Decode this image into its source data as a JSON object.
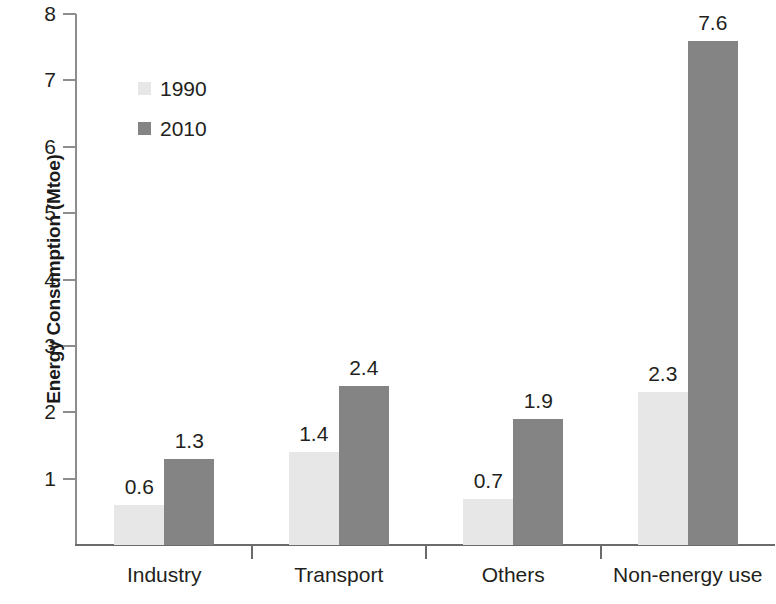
{
  "chart_data": {
    "type": "bar",
    "title": "",
    "xlabel": "",
    "ylabel": "Energy Consumption (Mtoe)",
    "categories": [
      "Industry",
      "Transport",
      "Others",
      "Non-energy use"
    ],
    "series": [
      {
        "name": "1990",
        "color": "#e7e7e7",
        "values": [
          0.6,
          1.4,
          0.7,
          2.3
        ]
      },
      {
        "name": "2010",
        "color": "#848484",
        "values": [
          1.3,
          2.4,
          1.9,
          7.6
        ]
      }
    ],
    "value_labels": {
      "1990": [
        "0.6",
        "1.4",
        "0.7",
        "2.3"
      ],
      "2010": [
        "1.3",
        "2.4",
        "1.9",
        "7.6"
      ]
    },
    "ylim": [
      0,
      8
    ],
    "yticks": [
      1,
      2,
      3,
      4,
      5,
      6,
      7,
      8
    ],
    "ytick_labels": [
      "1",
      "2",
      "3",
      "4",
      "5",
      "6",
      "7",
      "8"
    ],
    "grid": false,
    "legend_position": "upper-left-inside",
    "legend_entries": [
      "1990",
      "2010"
    ]
  }
}
